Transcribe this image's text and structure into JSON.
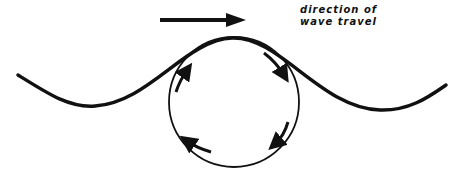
{
  "diagram": {
    "label_lines": [
      "direction of",
      "wave travel"
    ],
    "colors": {
      "stroke": "#111111",
      "background": "#ffffff"
    },
    "elements": {
      "wave": "sinusoidal surface wave",
      "orbit": "circular particle orbit under wave crest",
      "direction_arrow": "horizontal arrow pointing right",
      "orbit_arrows": 4,
      "orbit_direction": "clockwise"
    }
  }
}
